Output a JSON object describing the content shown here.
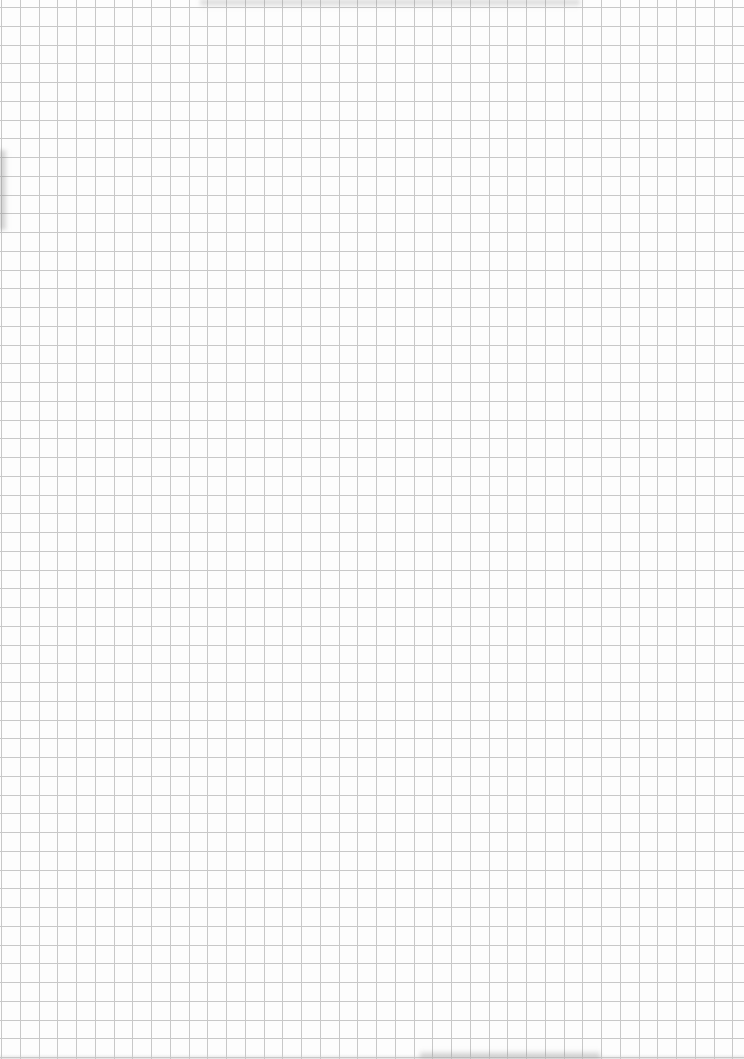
{
  "document": {
    "type": "graph-paper",
    "description": "Blank square-grid graph paper sheet, scanned",
    "text_content": []
  },
  "grid": {
    "cell_size_px": 18.75,
    "offset_x_px": 1,
    "offset_y_px": 7,
    "line_color": "#c8c8c8",
    "line_width_px": 1,
    "background_color": "#fdfdfd"
  },
  "colors": {
    "paper": "#fdfdfd",
    "grid_line": "#c8c8c8",
    "smudge": "#969696"
  }
}
